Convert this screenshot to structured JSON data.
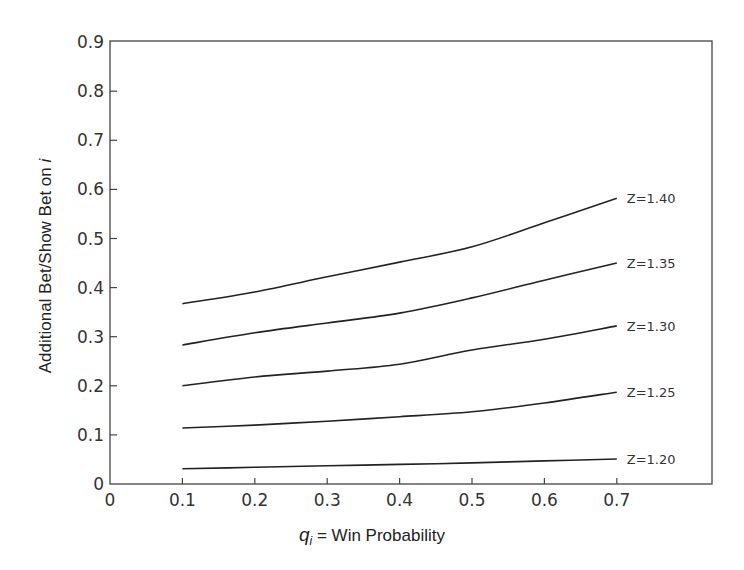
{
  "chart_data": {
    "type": "line",
    "title": "",
    "xlabel": "q_i = Win Probability",
    "xlabel_parts": {
      "var": "q",
      "sub": "i",
      "rest": " = Win Probability"
    },
    "ylabel": "Additional Bet/Show Bet on i",
    "ylabel_parts": {
      "main": "Additional Bet/Show Bet on ",
      "italic": "i"
    },
    "xlim": [
      0,
      0.85
    ],
    "ylim": [
      0,
      0.9
    ],
    "xticks": [
      "0",
      "0.1",
      "0.2",
      "0.3",
      "0.4",
      "0.5",
      "0.6",
      "0.7"
    ],
    "yticks": [
      "0",
      "0.1",
      "0.2",
      "0.3",
      "0.4",
      "0.5",
      "0.6",
      "0.7",
      "0.8",
      "0.9"
    ],
    "grid": false,
    "legend_position": "inline-right-of-curves",
    "x": [
      0.1,
      0.2,
      0.3,
      0.4,
      0.5,
      0.6,
      0.7
    ],
    "series": [
      {
        "name": "Z=1.40",
        "values": [
          0.367,
          0.391,
          0.422,
          0.452,
          0.483,
          0.532,
          0.582
        ]
      },
      {
        "name": "Z=1.35",
        "values": [
          0.283,
          0.308,
          0.328,
          0.348,
          0.379,
          0.415,
          0.45
        ]
      },
      {
        "name": "Z=1.30",
        "values": [
          0.2,
          0.218,
          0.23,
          0.244,
          0.273,
          0.295,
          0.322
        ]
      },
      {
        "name": "Z=1.25",
        "values": [
          0.114,
          0.12,
          0.128,
          0.137,
          0.147,
          0.165,
          0.187
        ]
      },
      {
        "name": "Z=1.20",
        "values": [
          0.031,
          0.034,
          0.037,
          0.04,
          0.043,
          0.047,
          0.051
        ]
      }
    ]
  },
  "colors": {
    "line": "#222222",
    "frame": "#444444",
    "background": "#ffffff"
  }
}
